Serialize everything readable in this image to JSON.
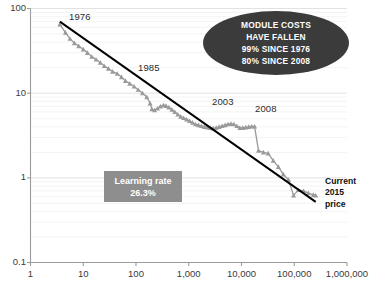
{
  "chart_data": {
    "type": "scatter",
    "title": "",
    "subtitle": "",
    "xlabel": "",
    "ylabel": "",
    "xscale": "log",
    "yscale": "log",
    "xlim": [
      1,
      1000000
    ],
    "ylim": [
      0.1,
      100
    ],
    "grid": true,
    "grid_minor": true,
    "legend_position": "none",
    "x_tick_labels": [
      "1",
      "10",
      "100",
      "1,000",
      "10,000",
      "100,000",
      "1,000,000"
    ],
    "x_tick_values": [
      1,
      10,
      100,
      1000,
      10000,
      100000,
      1000000
    ],
    "y_tick_labels": [
      "0.1",
      "1",
      "10",
      "100"
    ],
    "y_tick_values": [
      0.1,
      1,
      10,
      100
    ],
    "series": [
      {
        "name": "Module price",
        "marker": "triangle",
        "color": "#9a9a9a",
        "x": [
          3.6,
          4.6,
          5.6,
          6.8,
          8.2,
          10,
          12,
          14.5,
          17.5,
          21,
          25,
          30,
          36,
          44,
          53,
          63,
          76,
          92,
          110,
          133,
          160,
          185,
          200,
          225,
          255,
          290,
          330,
          370,
          420,
          480,
          545,
          620,
          705,
          800,
          910,
          1035,
          1180,
          1340,
          1525,
          1735,
          1975,
          2250,
          2560,
          2910,
          3310,
          3770,
          4290,
          4880,
          5550,
          6310,
          7180,
          8170,
          9290,
          10570,
          12020,
          13680,
          15560,
          17700,
          21000,
          26000,
          32000,
          40000,
          50000,
          62000,
          78000,
          97000,
          120000,
          150000,
          185000,
          230000,
          255000
        ],
        "y": [
          65,
          52,
          44,
          39,
          36,
          33,
          30,
          27,
          25,
          23,
          21,
          19.5,
          18,
          17,
          15.5,
          14,
          13,
          12,
          11,
          10,
          9,
          7.6,
          6.5,
          6.3,
          6.6,
          7.0,
          7.2,
          7.1,
          6.8,
          6.4,
          6.0,
          5.6,
          5.3,
          5.1,
          4.9,
          4.7,
          4.5,
          4.3,
          4.2,
          4.1,
          4.0,
          3.95,
          3.9,
          3.85,
          3.9,
          4.0,
          4.1,
          4.2,
          4.3,
          4.35,
          4.3,
          4.1,
          3.9,
          3.9,
          3.95,
          4.0,
          4.05,
          4.05,
          2.1,
          2.0,
          1.95,
          1.6,
          1.35,
          1.1,
          0.95,
          0.62,
          0.72,
          0.7,
          0.66,
          0.63,
          0.62
        ]
      }
    ],
    "trendline": {
      "name": "Learning curve fit",
      "color": "#000000",
      "x": [
        3.6,
        255000
      ],
      "y": [
        70,
        0.52
      ],
      "learning_rate_percent": 26.3
    },
    "annotations": [
      {
        "id": "year-1976",
        "text": "1976",
        "x_px": 69,
        "y_px": 11
      },
      {
        "id": "year-1985",
        "text": "1985",
        "x_px": 138,
        "y_px": 62
      },
      {
        "id": "year-2003",
        "text": "2003",
        "x_px": 212,
        "y_px": 96
      },
      {
        "id": "year-2008",
        "text": "2008",
        "x_px": 255,
        "y_px": 103
      }
    ],
    "callout": {
      "shape": "ellipse",
      "fill_color": "#3b3b3b",
      "text_color": "#ffffff",
      "lines": [
        "MODULE COSTS",
        "HAVE FALLEN",
        "99% SINCE 1976",
        "80% SINCE 2008"
      ]
    },
    "learning_rate_box": {
      "background_color": "#8e8e8e",
      "text_color": "#ffffff",
      "line1": "Learning rate",
      "line2": "26.3%"
    },
    "current_price_label": {
      "line1": "Current",
      "line2": "2015",
      "line3": "price",
      "color": "#111111"
    }
  },
  "colors": {
    "series": "#9a9a9a",
    "trendline": "#000000",
    "axis": "#9b9b9b",
    "gridline_major": "#e2e2e2",
    "gridline_minor": "#f0f0f0",
    "callout_fill": "#3b3b3b",
    "box_fill": "#8e8e8e",
    "background": "#ffffff"
  }
}
